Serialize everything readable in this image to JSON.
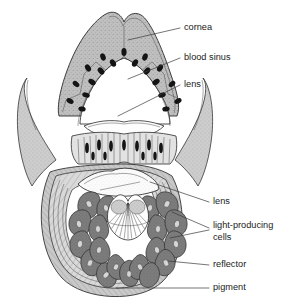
{
  "figure": {
    "background_color": "#ffffff",
    "width": 295,
    "height": 307
  },
  "palette": {
    "ink": "#2b2b2b",
    "leader_line": "#3a3a3a",
    "label_text": "#222222",
    "cornea_fill": "#c9c9c9",
    "tissue_fill": "#bdbdbd",
    "wing_fill": "#c4c4c4",
    "light_cell_fill": "#7e7e7e",
    "light_cell_dark": "#6a6a6a",
    "lens_fill": "#fbfbfb",
    "reflector_fill": "#d6d6d6",
    "pigment_fill": "#b6b6b6",
    "nucleus_fill": "#141414",
    "fan_fill": "#ffffff"
  },
  "labels": [
    {
      "id": "cornea",
      "text": "cornea",
      "text_x": 184,
      "text_y": 28,
      "leader": "M 180 28 L 128 40"
    },
    {
      "id": "blood-sinus",
      "text": "blood sinus",
      "text_x": 184,
      "text_y": 58,
      "leader": "M 180 58 L 128 79"
    },
    {
      "id": "lens-upper",
      "text": "lens",
      "text_x": 184,
      "text_y": 85,
      "leader": "M 180 85 L 118 116"
    },
    {
      "id": "lens-lower",
      "text": "lens",
      "text_x": 213,
      "text_y": 202,
      "leader": "M 209 202 L 150 182"
    },
    {
      "id": "light-producing-cells",
      "text": "light-producing",
      "text_line2": "cells",
      "text_x": 213,
      "text_y": 226,
      "text_y2": 238,
      "leader": "M 209 228 L 172 214",
      "leader2": "M 209 230 L 170 236"
    },
    {
      "id": "reflector",
      "text": "reflector",
      "text_x": 213,
      "text_y": 265,
      "leader": "M 209 265 L 168 262"
    },
    {
      "id": "pigment",
      "text": "pigment",
      "text_x": 213,
      "text_y": 288,
      "leader": "M 209 288 L 118 288"
    }
  ],
  "structures": [
    {
      "id": "cornea",
      "name": "cornea",
      "description": "Stippled light-grey dome with a shallow notch at the apex, forming the outer transparent cover of the organ."
    },
    {
      "id": "blood-sinus",
      "name": "blood sinus",
      "description": "Open cavity beneath the cornea, bounded by an arch of polygonal epithelial cells with dark oval nuclei."
    },
    {
      "id": "lens-upper",
      "name": "lens",
      "description": "Upper lens body lying below the blood sinus."
    },
    {
      "id": "striated-band",
      "name": "striated cell band",
      "description": "Band of vertically striated columnar cells with elongated dark nuclei, between the upper lens and the lower lens."
    },
    {
      "id": "lens-lower",
      "name": "lens",
      "description": "Lower lens: a pale, finely stippled lens-shaped body sitting above the light-producing cells."
    },
    {
      "id": "light-producing-cells",
      "name": "light-producing cells",
      "description": "Ring of dark-grey teardrop-shaped photocytes radiating outwards around the central fan."
    },
    {
      "id": "central-fan",
      "name": "central fan",
      "description": "White heart-shaped fan of radiating fibres at the centre of the photocyte ring."
    },
    {
      "id": "reflector",
      "name": "reflector",
      "description": "Concentric fibrous layer wrapping the photocyte mass, reflecting light outwards."
    },
    {
      "id": "pigment",
      "name": "pigment",
      "description": "Outermost hatched pigment sheath enclosing the whole organ."
    },
    {
      "id": "wing-left",
      "name": "left tissue flap",
      "description": "Curved grey tissue flap extending to the left of the organ."
    },
    {
      "id": "wing-right",
      "name": "right tissue flap",
      "description": "Curved grey tissue flap extending to the right of the organ."
    }
  ]
}
